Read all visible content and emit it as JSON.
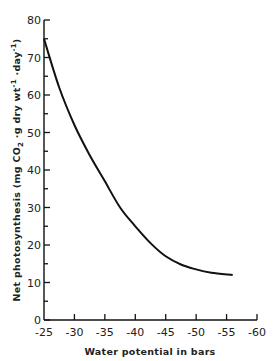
{
  "chart_data": {
    "type": "line",
    "title": "",
    "xlabel": "Water potential in bars",
    "ylabel": "Net photosynthesis (mg CO2 ·g dry wt⁻¹·day⁻¹)",
    "ylabel_parts": {
      "main": "Net photosynthesis",
      "unit_prefix": "(mg CO",
      "sub": "2",
      "unit_mid": " ·g  dry  wt",
      "sup1": "-1",
      "unit_mid2": " ·day",
      "sup2": "-1",
      "unit_end": ")"
    },
    "xlim": [
      -25,
      -60
    ],
    "ylim": [
      0,
      80
    ],
    "x_ticks": [
      -25,
      -30,
      -35,
      -40,
      -45,
      -50,
      -55,
      -60
    ],
    "x_tick_labels": [
      "-25",
      "-30",
      "-35",
      "-40",
      "-45",
      "-50",
      "-55",
      "-60"
    ],
    "y_ticks": [
      0,
      10,
      20,
      30,
      40,
      50,
      60,
      70,
      80
    ],
    "y_tick_labels": [
      "0",
      "10",
      "20",
      "30",
      "40",
      "50",
      "60",
      "70",
      "80"
    ],
    "y_minor_step": 5,
    "grid": false,
    "legend": null,
    "series": [
      {
        "name": "Net photosynthesis",
        "x": [
          -25,
          -27.5,
          -30,
          -32.5,
          -35,
          -37.5,
          -40,
          -42.5,
          -45,
          -47.5,
          -50,
          -52.5,
          -56
        ],
        "values": [
          75,
          62,
          52,
          44,
          37,
          30,
          25,
          20.5,
          17,
          14.8,
          13.5,
          12.6,
          12
        ]
      }
    ]
  }
}
